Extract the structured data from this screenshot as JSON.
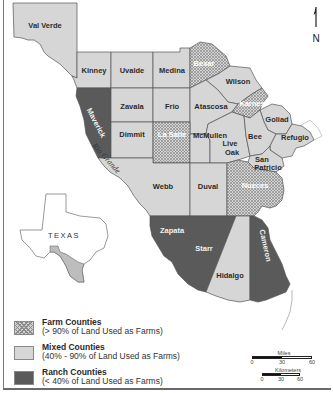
{
  "map": {
    "title": "South Texas Counties by Land Use",
    "north_arrow": {
      "icon": "north-arrow-icon",
      "label": "N"
    },
    "river_label": "Rio Grande",
    "inset": {
      "label": "TEXAS"
    },
    "colors": {
      "farm": "#cfcfcf",
      "farm_pattern": "#8d8d8d",
      "mixed": "#d6d6d6",
      "ranch": "#5a5a5a",
      "border": "#555555"
    },
    "counties": [
      {
        "name": "Val Verde",
        "category": "mixed"
      },
      {
        "name": "Kinney",
        "category": "mixed"
      },
      {
        "name": "Uvalde",
        "category": "mixed"
      },
      {
        "name": "Medina",
        "category": "mixed"
      },
      {
        "name": "Bexar",
        "category": "farm"
      },
      {
        "name": "Wilson",
        "category": "mixed"
      },
      {
        "name": "Maverick",
        "category": "ranch"
      },
      {
        "name": "Zavala",
        "category": "mixed"
      },
      {
        "name": "Frio",
        "category": "mixed"
      },
      {
        "name": "Atascosa",
        "category": "mixed"
      },
      {
        "name": "Karnes",
        "category": "farm"
      },
      {
        "name": "Goliad",
        "category": "mixed"
      },
      {
        "name": "Dimmit",
        "category": "mixed"
      },
      {
        "name": "La Salle",
        "category": "farm"
      },
      {
        "name": "McMullen",
        "category": "mixed"
      },
      {
        "name": "Live Oak",
        "category": "mixed"
      },
      {
        "name": "Bee",
        "category": "mixed"
      },
      {
        "name": "Refugio",
        "category": "mixed"
      },
      {
        "name": "San Patricio",
        "category": "mixed"
      },
      {
        "name": "Webb",
        "category": "mixed"
      },
      {
        "name": "Duval",
        "category": "mixed"
      },
      {
        "name": "Nueces",
        "category": "farm"
      },
      {
        "name": "Zapata",
        "category": "ranch"
      },
      {
        "name": "Starr",
        "category": "ranch"
      },
      {
        "name": "Hidalgo",
        "category": "mixed"
      },
      {
        "name": "Cameron",
        "category": "ranch"
      }
    ]
  },
  "legend": {
    "items": [
      {
        "title": "Farm Counties",
        "subtitle": "(> 90% of Land Used as Farms)",
        "category": "farm"
      },
      {
        "title": "Mixed Counties",
        "subtitle": "(40% - 90% of Land Used as Farms)",
        "category": "mixed"
      },
      {
        "title": "Ranch Counties",
        "subtitle": "(< 40% of Land Used as Farms)",
        "category": "ranch"
      }
    ]
  },
  "scale": {
    "miles": {
      "label": "Miles",
      "ticks": [
        "0",
        "30",
        "60"
      ]
    },
    "kilometers": {
      "label": "Kilometers",
      "ticks": [
        "0",
        "30",
        "60"
      ]
    }
  }
}
